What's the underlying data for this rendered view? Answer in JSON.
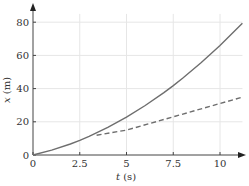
{
  "chart_data": {
    "type": "line",
    "title": "",
    "xlabel": "t (s)",
    "xlabel_var": "t",
    "xlabel_unit": " (s)",
    "ylabel": "x (m)",
    "ylabel_var": "x",
    "ylabel_unit": " (m)",
    "xlim": [
      0,
      11.2
    ],
    "ylim": [
      0,
      85
    ],
    "grid": true,
    "legend": null,
    "x_ticks": [
      0,
      2.5,
      5,
      7.5,
      10
    ],
    "x_tick_labels": [
      "0",
      "2.5",
      "5",
      "7.5",
      "10"
    ],
    "y_ticks": [
      0,
      20,
      40,
      60,
      80
    ],
    "y_tick_labels": [
      "0",
      "20",
      "40",
      "60",
      "80"
    ],
    "series": [
      {
        "name": "position",
        "style": "solid",
        "color": "#6e6e6e",
        "x": [
          0,
          1,
          2,
          2.5,
          3,
          4,
          5,
          6,
          7,
          7.5,
          8,
          9,
          10,
          11.2
        ],
        "values": [
          0,
          2.9,
          6.6,
          8.8,
          11.2,
          16.6,
          22.8,
          29.8,
          37.6,
          41.8,
          46.2,
          55.7,
          66.0,
          79.4
        ]
      },
      {
        "name": "tangent",
        "style": "dashed",
        "color": "#6e6e6e",
        "x": [
          3.4,
          5,
          7.5,
          10,
          11.2
        ],
        "values": [
          11.9,
          15,
          23,
          31,
          34.8
        ]
      }
    ]
  },
  "labels": {
    "x_axis_var": "t",
    "x_axis_unit": " (s)",
    "y_axis_var": "x",
    "y_axis_unit": " (m)"
  }
}
